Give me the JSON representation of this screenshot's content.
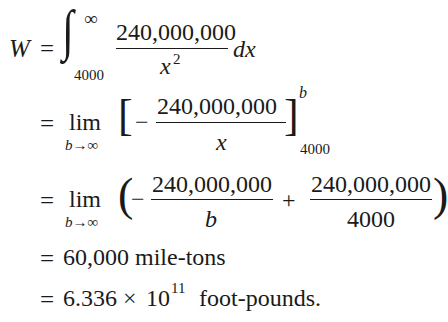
{
  "line1": {
    "lhs": "W",
    "eq": "=",
    "integral": "∫",
    "upper_limit": "∞",
    "lower_limit": "4000",
    "numerator": "240,000,000",
    "denominator_var": "x",
    "denominator_exp": "2",
    "differential": "dx"
  },
  "line2": {
    "eq": "=",
    "lim": "lim",
    "lim_sub": "b→∞",
    "open_bracket": "[",
    "minus": "−",
    "numerator": "240,000,000",
    "denominator": "x",
    "close_bracket": "]",
    "upper_eval": "b",
    "lower_eval": "4000"
  },
  "line3": {
    "eq": "=",
    "lim": "lim",
    "lim_sub": "b→∞",
    "open_paren": "(",
    "minus": "−",
    "numerator1": "240,000,000",
    "denominator1": "b",
    "plus": "+",
    "numerator2": "240,000,000",
    "denominator2": "4000",
    "close_paren": ")"
  },
  "line4": {
    "eq": "=",
    "text": "60,000 mile-tons"
  },
  "line5": {
    "eq": "=",
    "mantissa": "6.336 ×",
    "base": "10",
    "exponent": "11",
    "unit": "foot-pounds."
  }
}
